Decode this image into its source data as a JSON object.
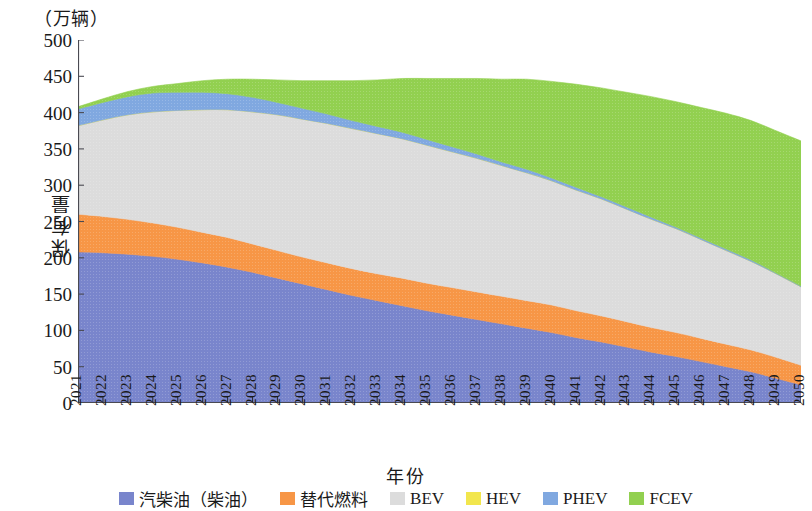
{
  "figure": {
    "unit_caption": "（万辆）",
    "x_axis_title": "年份",
    "y_axis_title": "保有量"
  },
  "legend": {
    "items": [
      {
        "label": "汽柴油（柴油）",
        "color": "#7985cc",
        "key": "gasoline_diesel"
      },
      {
        "label": "替代燃料",
        "color": "#f79646",
        "key": "alt_fuel"
      },
      {
        "label": "BEV",
        "color": "#dcdcdc",
        "key": "bev"
      },
      {
        "label": "HEV",
        "color": "#f2e64d",
        "key": "hev"
      },
      {
        "label": "PHEV",
        "color": "#80a8e0",
        "key": "phev"
      },
      {
        "label": "FCEV",
        "color": "#92d050",
        "key": "fcev"
      }
    ]
  },
  "chart_data": {
    "type": "area",
    "stacked": true,
    "title": "",
    "xlabel": "年份",
    "ylabel": "保有量",
    "unit": "万辆",
    "ylim": [
      0,
      500
    ],
    "ytick_labels": [
      "500",
      "450",
      "400",
      "350",
      "300",
      "250",
      "200",
      "150",
      "100",
      "50",
      "0"
    ],
    "ytick_values": [
      500,
      450,
      400,
      350,
      300,
      250,
      200,
      150,
      100,
      50,
      0
    ],
    "grid": false,
    "legend_position": "bottom",
    "categories": [
      "2021",
      "2022",
      "2023",
      "2024",
      "2025",
      "2026",
      "2027",
      "2028",
      "2029",
      "2030",
      "2031",
      "2032",
      "2033",
      "2034",
      "2035",
      "2036",
      "2037",
      "2038",
      "2039",
      "2040",
      "2041",
      "2042",
      "2043",
      "2044",
      "2045",
      "2046",
      "2047",
      "2048",
      "2049",
      "2050"
    ],
    "series": [
      {
        "name": "汽柴油（柴油）",
        "color": "#7985cc",
        "values": [
          208,
          207,
          205,
          202,
          198,
          193,
          187,
          180,
          172,
          164,
          156,
          148,
          141,
          134,
          127,
          121,
          115,
          109,
          103,
          97,
          90,
          84,
          77,
          70,
          64,
          57,
          50,
          43,
          34,
          25
        ]
      },
      {
        "name": "替代燃料",
        "color": "#f79646",
        "values": [
          52,
          50,
          48,
          46,
          44,
          42,
          41,
          39,
          38,
          37,
          37,
          37,
          37,
          38,
          38,
          38,
          38,
          38,
          38,
          38,
          37,
          36,
          35,
          34,
          33,
          32,
          31,
          30,
          29,
          27
        ]
      },
      {
        "name": "BEV",
        "color": "#dcdcdc",
        "values": [
          122,
          133,
          144,
          153,
          161,
          169,
          176,
          182,
          187,
          190,
          192,
          193,
          193,
          192,
          190,
          187,
          184,
          180,
          176,
          171,
          166,
          161,
          155,
          149,
          143,
          136,
          129,
          122,
          115,
          108
        ]
      },
      {
        "name": "HEV",
        "color": "#f2e64d",
        "values": [
          0,
          0,
          0,
          0,
          0,
          0,
          0,
          0,
          0,
          0,
          0,
          0,
          0,
          0,
          0,
          0,
          0,
          0,
          0,
          0,
          0,
          0,
          0,
          0,
          0,
          0,
          0,
          0,
          0,
          0
        ]
      },
      {
        "name": "PHEV",
        "color": "#80a8e0",
        "values": [
          23,
          24,
          25,
          26,
          25,
          24,
          22,
          20,
          17,
          15,
          13,
          11,
          10,
          9,
          8,
          7,
          6,
          5,
          5,
          4,
          4,
          3,
          3,
          3,
          2,
          2,
          2,
          2,
          1,
          1
        ]
      },
      {
        "name": "FCEV",
        "color": "#92d050",
        "values": [
          3,
          5,
          7,
          9,
          12,
          16,
          20,
          25,
          31,
          38,
          46,
          55,
          64,
          74,
          84,
          94,
          104,
          114,
          124,
          133,
          142,
          150,
          158,
          166,
          173,
          180,
          187,
          192,
          196,
          200
        ]
      }
    ],
    "totals": [
      408,
      419,
      429,
      436,
      440,
      444,
      446,
      446,
      445,
      444,
      444,
      444,
      445,
      447,
      447,
      447,
      447,
      446,
      446,
      443,
      439,
      434,
      428,
      422,
      415,
      407,
      399,
      389,
      375,
      361
    ]
  }
}
